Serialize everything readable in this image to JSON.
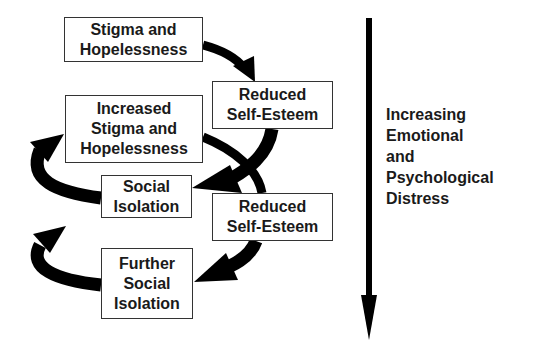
{
  "diagram": {
    "boxes": [
      {
        "id": "stigma-hopelessness",
        "lines": [
          "Stigma and",
          "Hopelessness"
        ]
      },
      {
        "id": "reduced-self-esteem-1",
        "lines": [
          "Reduced",
          "Self-Esteem"
        ]
      },
      {
        "id": "increased-stigma-hopelessness",
        "lines": [
          "Increased",
          "Stigma and",
          "Hopelessness"
        ]
      },
      {
        "id": "social-isolation",
        "lines": [
          "Social",
          "Isolation"
        ]
      },
      {
        "id": "reduced-self-esteem-2",
        "lines": [
          "Reduced",
          "Self-Esteem"
        ]
      },
      {
        "id": "further-social-isolation",
        "lines": [
          "Further",
          "Social",
          "Isolation"
        ]
      }
    ],
    "side_label": {
      "lines": [
        "Increasing",
        "Emotional",
        "and",
        "Psychological",
        "Distress"
      ]
    },
    "arrow_color": "#000000",
    "box_border_color": "#333333"
  }
}
